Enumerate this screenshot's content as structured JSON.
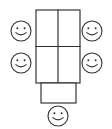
{
  "diagram": {
    "title": "Table seating arrangement",
    "background_color": "#ffffff",
    "line_color": "#2e2e2e",
    "face_color": "#333333",
    "canvas": {
      "width": 112,
      "height": 129
    },
    "table": {
      "label": "main-table",
      "x": 36,
      "y": 10,
      "width": 44,
      "height": 73,
      "columns": 2,
      "rows": 2,
      "vertical_divider_x": 58,
      "horizontal_divider_y": 46.5,
      "cells": [
        {
          "label": "cell-top-left"
        },
        {
          "label": "cell-top-right"
        },
        {
          "label": "cell-bottom-left"
        },
        {
          "label": "cell-bottom-right"
        }
      ]
    },
    "head_panel": {
      "label": "head-panel",
      "x": 41,
      "y": 83,
      "width": 35,
      "height": 20
    },
    "seats": [
      {
        "label": "seat-left-top",
        "position": "left-top",
        "cx": 21,
        "cy": 31,
        "r": 10,
        "expression": "smile"
      },
      {
        "label": "seat-right-top",
        "position": "right-top",
        "cx": 92,
        "cy": 31,
        "r": 10,
        "expression": "smile"
      },
      {
        "label": "seat-left-bottom",
        "position": "left-bottom",
        "cx": 21,
        "cy": 63,
        "r": 10,
        "expression": "smile"
      },
      {
        "label": "seat-right-bottom",
        "position": "right-bottom",
        "cx": 92,
        "cy": 63,
        "r": 10,
        "expression": "smile"
      },
      {
        "label": "seat-head",
        "position": "bottom-head",
        "cx": 58,
        "cy": 116,
        "r": 10,
        "expression": "smile"
      }
    ],
    "seat_count": 5
  }
}
